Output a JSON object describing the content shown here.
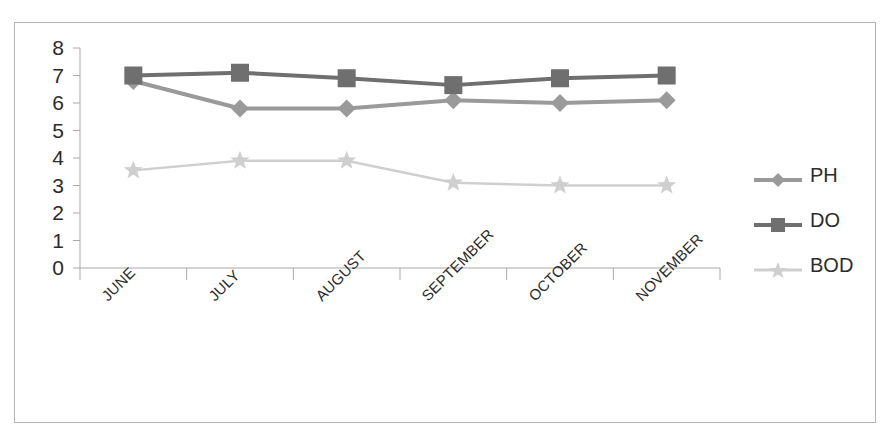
{
  "chart_data": {
    "type": "line",
    "title": "",
    "xlabel": "",
    "ylabel": "",
    "categories": [
      "JUNE",
      "JULY",
      "AUGUST",
      "SEPTEMBER",
      "OCTOBER",
      "NOVEMBER"
    ],
    "ylim": [
      0,
      8
    ],
    "ytick_labels": [
      "8",
      "7",
      "6",
      "5",
      "4",
      "3",
      "2",
      "1",
      "0"
    ],
    "ytick_values": [
      8,
      7,
      6,
      5,
      4,
      3,
      2,
      1,
      0
    ],
    "ytick_step": 1,
    "grid": false,
    "legend_position": "right",
    "series": [
      {
        "name": "PH",
        "values": [
          6.8,
          5.8,
          5.8,
          6.1,
          6.0,
          6.1
        ],
        "color": "#9a9a9a",
        "marker": "diamond"
      },
      {
        "name": "DO",
        "values": [
          7.0,
          7.1,
          6.9,
          6.65,
          6.9,
          7.0
        ],
        "color": "#6f6f6f",
        "marker": "square"
      },
      {
        "name": "BOD",
        "values": [
          3.55,
          3.9,
          3.9,
          3.1,
          3.0,
          3.0
        ],
        "color": "#cfcfcf",
        "marker": "star"
      }
    ]
  },
  "legend": {
    "items": [
      {
        "label": "PH"
      },
      {
        "label": "DO"
      },
      {
        "label": "BOD"
      }
    ]
  },
  "colors": {
    "ph": "#9a9a9a",
    "do": "#6f6f6f",
    "bod": "#cfcfcf",
    "axis": "#a9a9a9",
    "frame": "#b4b4b4",
    "text": "#2b2b2b",
    "background": "#ffffff"
  }
}
